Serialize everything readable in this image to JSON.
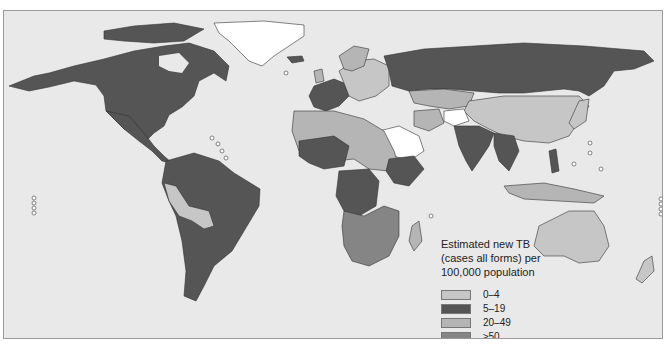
{
  "map": {
    "title": "Estimated new TB (cases all forms) per 100,000 population",
    "title_lines": [
      "Estimated new TB",
      "(cases all forms) per",
      "100,000 population"
    ],
    "background_color": "#e9e9e9",
    "border_color": "#9a9a9a"
  },
  "legend": {
    "items": [
      {
        "label": "0–4",
        "color": "#c6c6c6"
      },
      {
        "label": "5–19",
        "color": "#555555"
      },
      {
        "label": "20–49",
        "color": "#b5b5b5"
      },
      {
        "label": "≥50",
        "color": "#858585"
      },
      {
        "label": "No estimate",
        "color": "#ffffff"
      }
    ]
  },
  "regions": {
    "north_america": "5–19",
    "greenland": "No estimate",
    "south_america_most": "5–19",
    "peru_bolivia": "0–4",
    "europe_west": "5–19",
    "europe_east": "0–4",
    "russia": "5–19",
    "china_mongolia": "0–4",
    "india": "5–19",
    "saudi_arabia_afghanistan": "No estimate",
    "southern_africa": "≥50",
    "central_africa": "5–19",
    "australia": "0–4"
  }
}
